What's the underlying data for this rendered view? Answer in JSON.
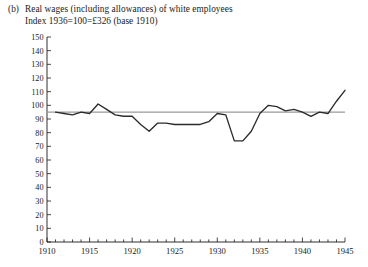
{
  "caption": {
    "tag": "(b)",
    "line1": "Real wages (including allowances) of white employees",
    "line2": "Index 1936=100=£326 (base 1910)"
  },
  "colors": {
    "data_line": "#2b2b2b",
    "reference_line": "#9a9a9a",
    "axis": "#1a1a1a",
    "background": "#ffffff"
  },
  "chart_data": {
    "type": "line",
    "title": "Real wages (including allowances) of white employees",
    "subtitle": "Index 1936=100=£326 (base 1910)",
    "xlabel": "",
    "ylabel": "",
    "xlim": [
      1910,
      1945
    ],
    "ylim": [
      0,
      150
    ],
    "grid": false,
    "legend": "none",
    "yticks": [
      0,
      10,
      20,
      30,
      40,
      50,
      60,
      70,
      80,
      90,
      100,
      110,
      120,
      130,
      140,
      150
    ],
    "ytick_labels": [
      "0",
      "10",
      "20",
      "30",
      "40",
      "50",
      "60",
      "70",
      "80",
      "90",
      "100",
      "110",
      "120",
      "130",
      "140",
      "150"
    ],
    "xticks": [
      1910,
      1915,
      1920,
      1925,
      1930,
      1935,
      1940,
      1945
    ],
    "xtick_labels": [
      "1910",
      "1915",
      "1920",
      "1925",
      "1930",
      "1935",
      "1940",
      "1945"
    ],
    "minor_xticks_every": 1,
    "annotations": [
      {
        "kind": "horizontal-reference-line",
        "y": 95,
        "color": "#9a9a9a"
      }
    ],
    "series": [
      {
        "name": "Real wages index (white employees)",
        "color": "#2b2b2b",
        "x": [
          1911,
          1912,
          1913,
          1914,
          1915,
          1916,
          1917,
          1918,
          1919,
          1920,
          1921,
          1922,
          1923,
          1924,
          1925,
          1926,
          1927,
          1928,
          1929,
          1930,
          1931,
          1932,
          1933,
          1934,
          1935,
          1936,
          1937,
          1938,
          1939,
          1940,
          1941,
          1942,
          1943,
          1944,
          1945
        ],
        "values": [
          95,
          94,
          93,
          95,
          94,
          101,
          97,
          93,
          92,
          92,
          86,
          81,
          87,
          87,
          86,
          86,
          86,
          86,
          88,
          94,
          93,
          74,
          74,
          81,
          94,
          100,
          99,
          96,
          97,
          95,
          92,
          95,
          94,
          103,
          111
        ]
      }
    ]
  }
}
